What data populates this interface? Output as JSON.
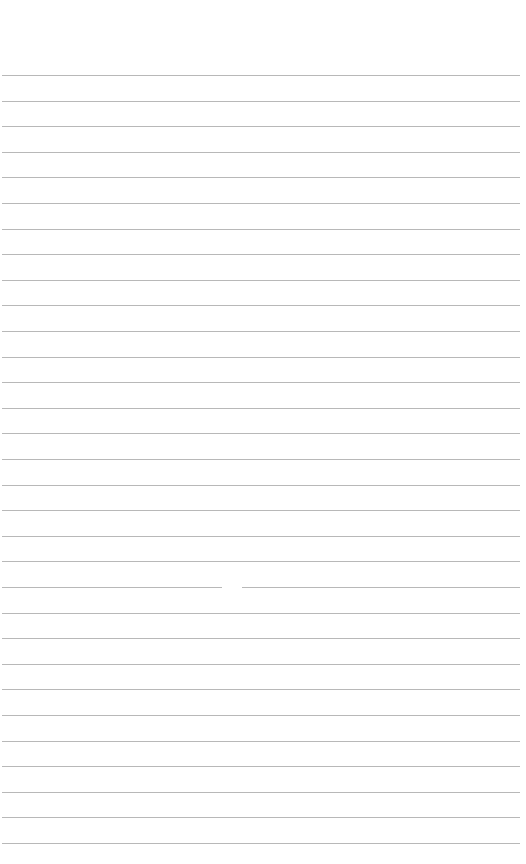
{
  "page": {
    "type": "ruled-paper",
    "background_color": "#ffffff",
    "line_color": "#b8b8b8",
    "first_line_y": 75,
    "line_spacing": 25.6,
    "line_count": 31
  }
}
